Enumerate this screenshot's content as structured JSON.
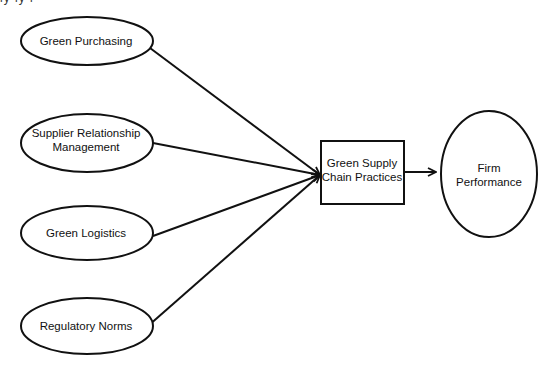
{
  "diagram": {
    "type": "conceptual-framework",
    "top_fragment": "ly ly l",
    "nodes": [
      {
        "id": "gp",
        "shape": "ellipse",
        "lines": [
          "Green Purchasing"
        ]
      },
      {
        "id": "srm",
        "shape": "ellipse",
        "lines": [
          "Supplier Relationship",
          "Management"
        ]
      },
      {
        "id": "gl",
        "shape": "ellipse",
        "lines": [
          "Green Logistics"
        ]
      },
      {
        "id": "rn",
        "shape": "ellipse",
        "lines": [
          "Regulatory Norms"
        ]
      },
      {
        "id": "gscp",
        "shape": "rectangle",
        "lines": [
          "Green Supply",
          "Chain Practices"
        ]
      },
      {
        "id": "fp",
        "shape": "ellipse",
        "lines": [
          "Firm",
          "Performance"
        ]
      }
    ],
    "edges": [
      {
        "from": "gp",
        "to": "gscp"
      },
      {
        "from": "srm",
        "to": "gscp"
      },
      {
        "from": "gl",
        "to": "gscp"
      },
      {
        "from": "rn",
        "to": "gscp"
      },
      {
        "from": "gscp",
        "to": "fp"
      }
    ],
    "colors": {
      "stroke": "#111111",
      "fill": "#ffffff",
      "background": "#ffffff"
    }
  }
}
